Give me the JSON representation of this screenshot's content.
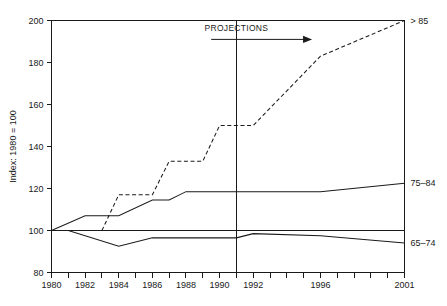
{
  "chart_data": {
    "type": "line",
    "title": "",
    "xlabel": "",
    "ylabel": "Index: 1980 = 100",
    "xlim": [
      1980,
      2001
    ],
    "ylim": [
      80,
      200
    ],
    "grid": false,
    "legend_position": "right-of-plot-inline",
    "y_ticks": [
      80,
      100,
      120,
      140,
      160,
      180,
      200
    ],
    "y_tick_labels": [
      "80",
      "100",
      "120",
      "140",
      "160",
      "180",
      "200"
    ],
    "x_ticks": [
      1980,
      1981,
      1982,
      1983,
      1984,
      1985,
      1986,
      1987,
      1988,
      1989,
      1990,
      1991,
      1992,
      1993,
      1994,
      1995,
      1996,
      1997,
      1998,
      1999,
      2000,
      2001
    ],
    "x_tick_labels": [
      {
        "x": 1980,
        "label": "1980"
      },
      {
        "x": 1982,
        "label": "1982"
      },
      {
        "x": 1984,
        "label": "1984"
      },
      {
        "x": 1986,
        "label": "1986"
      },
      {
        "x": 1988,
        "label": "1988"
      },
      {
        "x": 1990,
        "label": "1990"
      },
      {
        "x": 1992,
        "label": "1992"
      },
      {
        "x": 1996,
        "label": "1996"
      },
      {
        "x": 2001,
        "label": "2001"
      }
    ],
    "reference_line": {
      "y": 100,
      "style": "solid"
    },
    "projection_divider": {
      "x": 1991,
      "style": "solid"
    },
    "annotations": [
      {
        "name": "projections",
        "text": "PROJECTIONS",
        "x": 1991,
        "y": 195,
        "arrow": {
          "from_x": 1989.5,
          "to_x": 1995.5,
          "y": 191
        }
      }
    ],
    "series": [
      {
        "name": "> 85",
        "label": ">85",
        "display_label": "> 85",
        "style": "dashed",
        "label_y": 200,
        "points": [
          {
            "x": 1983,
            "y": 100
          },
          {
            "x": 1984,
            "y": 117
          },
          {
            "x": 1986,
            "y": 117
          },
          {
            "x": 1987,
            "y": 133
          },
          {
            "x": 1989,
            "y": 133
          },
          {
            "x": 1990,
            "y": 150
          },
          {
            "x": 1992,
            "y": 150
          },
          {
            "x": 1996,
            "y": 183
          },
          {
            "x": 2001,
            "y": 200
          }
        ]
      },
      {
        "name": "75-84",
        "label": "75–84",
        "display_label": "75–84",
        "style": "solid",
        "label_y": 122.5,
        "points": [
          {
            "x": 1980,
            "y": 100
          },
          {
            "x": 1982,
            "y": 107
          },
          {
            "x": 1984,
            "y": 107
          },
          {
            "x": 1986,
            "y": 114.5
          },
          {
            "x": 1987,
            "y": 114.5
          },
          {
            "x": 1988,
            "y": 118.5
          },
          {
            "x": 1996,
            "y": 118.5
          },
          {
            "x": 2001,
            "y": 122.5
          }
        ]
      },
      {
        "name": "65-74",
        "label": "65–74",
        "display_label": "65–74",
        "style": "solid",
        "label_y": 94,
        "points": [
          {
            "x": 1980,
            "y": 100
          },
          {
            "x": 1981,
            "y": 100
          },
          {
            "x": 1984,
            "y": 92.5
          },
          {
            "x": 1986,
            "y": 96.5
          },
          {
            "x": 1991,
            "y": 96.5
          },
          {
            "x": 1992,
            "y": 98.5
          },
          {
            "x": 1996,
            "y": 97.5
          },
          {
            "x": 2001,
            "y": 94
          }
        ]
      }
    ]
  }
}
